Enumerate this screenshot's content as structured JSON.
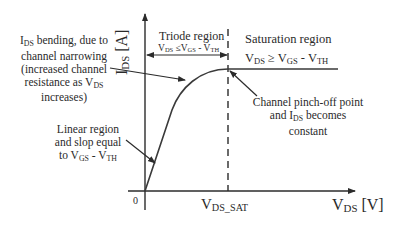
{
  "diagram": {
    "type": "MOSFET I-V output characteristic",
    "colors": {
      "line": "#2b2b2b",
      "curve": "#3a3a3a",
      "text": "#2a2a2a",
      "background": "#ffffff"
    },
    "y_axis": {
      "label_main": "I",
      "label_sub": "DS",
      "label_unit": " [A]"
    },
    "x_axis": {
      "label_main": "V",
      "label_sub": "DS",
      "label_unit": " [V]",
      "origin_label": "0"
    },
    "vds_sat": {
      "main": "V",
      "sub": "DS_SAT"
    },
    "triode": {
      "title": "Triode region",
      "cond": {
        "v1": "V",
        "s1": "DS",
        "op": " ≤V",
        "s2": "GS",
        "rest": " - V",
        "s3": "TH"
      }
    },
    "saturation": {
      "title": "Saturation region",
      "cond": {
        "v1": "V",
        "s1": "DS",
        "op": " ≥ V",
        "s2": "GS",
        "rest": " - V",
        "s3": "TH"
      }
    },
    "annotations": {
      "bending": {
        "line1_main": "I",
        "line1_sub": "DS",
        "line1_rest": " bending, due to",
        "line2": "channel narrowing",
        "line3": "(increased channel",
        "line4_main": "resistance as V",
        "line4_sub": "DS",
        "line5": "increases)"
      },
      "linear": {
        "line1": "Linear region",
        "line2": "and slop equal",
        "line3_main": "to V",
        "line3_sub": "GS",
        "line3_rest": " - V",
        "line3_sub2": "TH"
      },
      "pinchoff": {
        "line1": "Channel pinch-off point",
        "line2_main": "and I",
        "line2_sub": "DS",
        "line2_rest": " becomes",
        "line3": "constant"
      }
    }
  }
}
